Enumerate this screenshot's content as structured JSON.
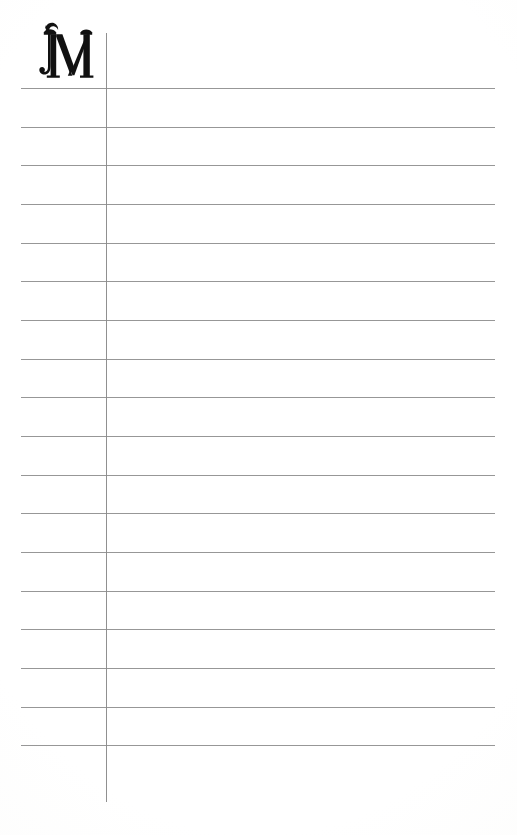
{
  "page": {
    "kind": "blank-ruled-ledger-page",
    "background_color": "#fefefe",
    "width_px": 517,
    "height_px": 835
  },
  "header": {
    "initial_letter": "M",
    "initial_style": "decorative-blackletter-swash",
    "initial_color": "#111111",
    "initial_name": "decorative-initial-m"
  },
  "ruling": {
    "line_color": "#8e8e8e",
    "line_thickness_px": 1,
    "line_left_px": 21,
    "line_right_px": 495,
    "line_count": 18,
    "line_spacing_px": 38.7,
    "first_line_y_px": 88,
    "last_line_y_px": 745,
    "line_y_positions": [
      88,
      126.6,
      165.3,
      204,
      242.6,
      281.3,
      320,
      358.6,
      397.3,
      436,
      474.6,
      513.3,
      552,
      590.6,
      629.3,
      668,
      706.6,
      745.3
    ]
  },
  "column_divider": {
    "color": "#8a8a8a",
    "thickness_px": 1,
    "x_px": 106,
    "top_y_px": 33,
    "bottom_y_px": 802
  },
  "content": {
    "entries": [],
    "note": ""
  }
}
